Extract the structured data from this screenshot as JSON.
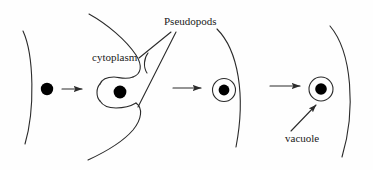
{
  "figure": {
    "background_color": "#fefefe",
    "stroke_color": "#2b2b2b",
    "fill_color": "#000000",
    "width": 373,
    "height": 170
  },
  "labels": {
    "pseudopods": "Pseudopods",
    "cytoplasm": "cytoplasm",
    "vacuole": "vacuole"
  },
  "stages": [
    {
      "id": "stage-1",
      "name": "particle-outside-cell",
      "has_cell_membrane_arc": true,
      "has_particle": true,
      "has_vacuole_ring": false
    },
    {
      "id": "stage-2",
      "name": "pseudopods-engulfing-particle",
      "has_cell_membrane_arc": true,
      "has_particle": true,
      "has_vacuole_ring": false,
      "has_pseudopods": true
    },
    {
      "id": "stage-3",
      "name": "particle-enclosed-in-vacuole",
      "has_cell_membrane_arc": true,
      "has_particle": true,
      "has_vacuole_ring": true
    },
    {
      "id": "stage-4",
      "name": "vacuole-inside-cell",
      "has_cell_membrane_arc": true,
      "has_particle": true,
      "has_vacuole_ring": true
    }
  ],
  "arrows": [
    {
      "id": "arrow-1",
      "from": "stage-1",
      "to": "stage-2"
    },
    {
      "id": "arrow-2",
      "from": "stage-2",
      "to": "stage-3"
    },
    {
      "id": "arrow-3",
      "from": "stage-3",
      "to": "stage-4"
    }
  ],
  "leader_lines": [
    {
      "id": "pseudopods-leader-upper",
      "label": "pseudopods"
    },
    {
      "id": "pseudopods-leader-lower",
      "label": "pseudopods"
    },
    {
      "id": "cytoplasm-leader",
      "label": "cytoplasm"
    },
    {
      "id": "vacuole-leader",
      "label": "vacuole"
    }
  ]
}
